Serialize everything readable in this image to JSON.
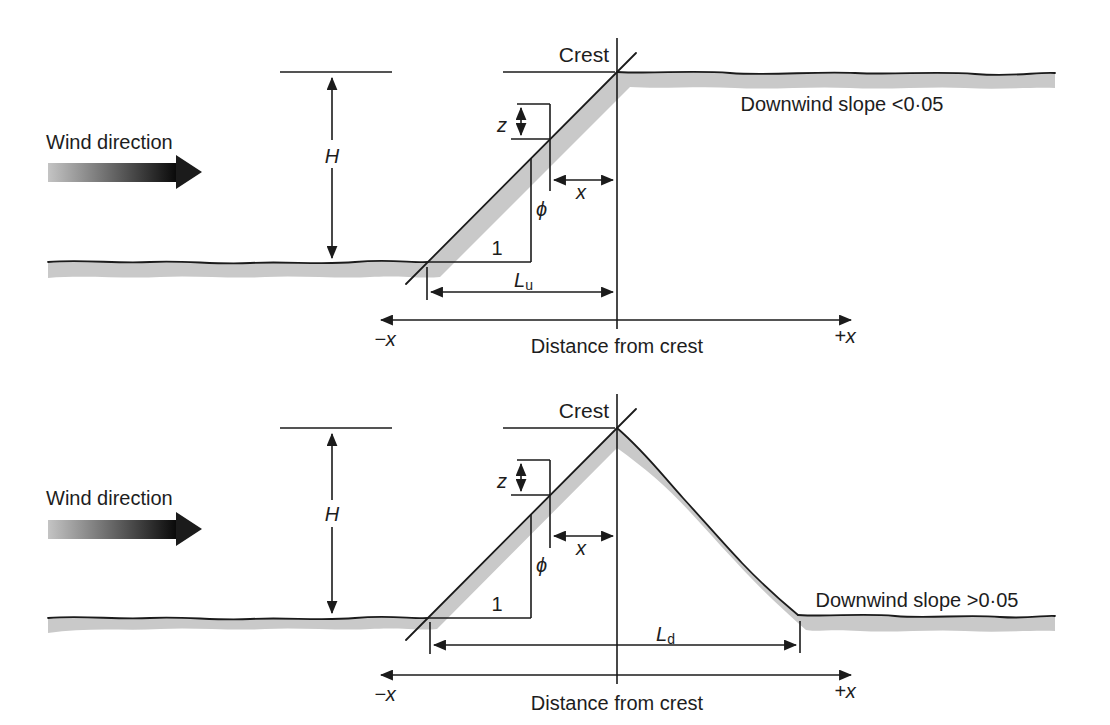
{
  "panels": {
    "top": {
      "wind_label": "Wind direction",
      "crest_label": "Crest",
      "slope_note": "Downwind slope <0·05",
      "height_label": "H",
      "z_label": "z",
      "x_label": "x",
      "phi_label": "ϕ",
      "unit_run_label": "1",
      "length_base": "L",
      "length_sub": "u",
      "axis_neg_label": "−x",
      "axis_pos_label": "+x",
      "axis_title": "Distance from crest"
    },
    "bottom": {
      "wind_label": "Wind direction",
      "crest_label": "Crest",
      "slope_note": "Downwind slope >0·05",
      "height_label": "H",
      "z_label": "z",
      "x_label": "x",
      "phi_label": "ϕ",
      "unit_run_label": "1",
      "length_base": "L",
      "length_sub": "d",
      "axis_neg_label": "−x",
      "axis_pos_label": "+x",
      "axis_title": "Distance from crest"
    }
  },
  "colors": {
    "ink": "#1b1b1b",
    "ground_fill": "#c9c9c9",
    "background": "#ffffff",
    "wind_gradient_start": "#c4c4c4",
    "wind_gradient_end": "#0a0a0a"
  }
}
